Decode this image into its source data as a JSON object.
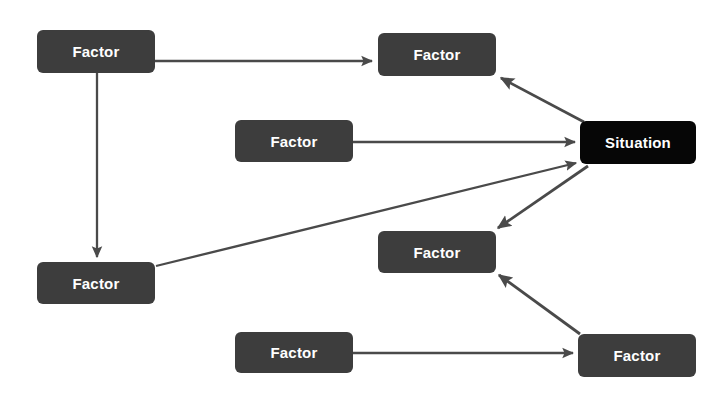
{
  "diagram": {
    "type": "node-link-diagram",
    "canvas": {
      "width": 718,
      "height": 407,
      "background": "#ffffff"
    },
    "colors": {
      "factor_fill": "#3d3d3d",
      "situation_fill": "#060606",
      "node_text": "#ffffff",
      "edge_stroke": "#4a4a4a",
      "background": "#ffffff"
    },
    "nodes": [
      {
        "id": "factor-top-left",
        "label": "Factor",
        "kind": "factor",
        "x": 37,
        "y": 30,
        "w": 118,
        "h": 43
      },
      {
        "id": "factor-top-right",
        "label": "Factor",
        "kind": "factor",
        "x": 378,
        "y": 33,
        "w": 118,
        "h": 43
      },
      {
        "id": "factor-middle",
        "label": "Factor",
        "kind": "factor",
        "x": 235,
        "y": 120,
        "w": 118,
        "h": 42
      },
      {
        "id": "situation",
        "label": "Situation",
        "kind": "situation",
        "x": 580,
        "y": 121,
        "w": 116,
        "h": 43
      },
      {
        "id": "factor-mid-right",
        "label": "Factor",
        "kind": "factor",
        "x": 378,
        "y": 231,
        "w": 118,
        "h": 42
      },
      {
        "id": "factor-bottom-left",
        "label": "Factor",
        "kind": "factor",
        "x": 37,
        "y": 262,
        "w": 118,
        "h": 42
      },
      {
        "id": "factor-bottom-middle",
        "label": "Factor",
        "kind": "factor",
        "x": 235,
        "y": 332,
        "w": 118,
        "h": 41
      },
      {
        "id": "factor-bottom-right",
        "label": "Factor",
        "kind": "factor",
        "x": 578,
        "y": 334,
        "w": 118,
        "h": 43
      }
    ],
    "edges": [
      {
        "id": "edge-1",
        "from": "factor-top-left",
        "to": "factor-top-right",
        "direction": "right",
        "arrowhead": "to"
      },
      {
        "id": "edge-2",
        "from": "factor-top-left",
        "to": "factor-bottom-left",
        "direction": "down",
        "arrowhead": "to"
      },
      {
        "id": "edge-3",
        "from": "factor-middle",
        "to": "situation",
        "direction": "right",
        "arrowhead": "to"
      },
      {
        "id": "edge-4",
        "from": "factor-bottom-left",
        "to": "situation",
        "direction": "up-right",
        "arrowhead": "to"
      },
      {
        "id": "edge-5",
        "from": "situation",
        "to": "factor-top-right",
        "direction": "up-left",
        "arrowhead": "to"
      },
      {
        "id": "edge-6",
        "from": "situation",
        "to": "factor-mid-right",
        "direction": "down-left",
        "arrowhead": "to"
      },
      {
        "id": "edge-7",
        "from": "factor-bottom-right",
        "to": "factor-mid-right",
        "direction": "up-left",
        "arrowhead": "to"
      },
      {
        "id": "edge-8",
        "from": "factor-bottom-middle",
        "to": "factor-bottom-right",
        "direction": "right",
        "arrowhead": "to"
      }
    ]
  }
}
